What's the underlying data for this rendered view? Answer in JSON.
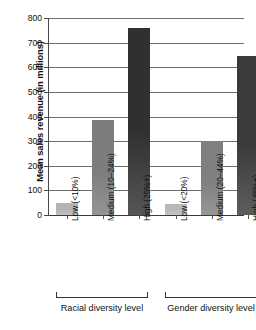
{
  "chart_data": {
    "type": "bar",
    "title": "",
    "xlabel": "",
    "ylabel": "Mean sales revenue (in millions)",
    "ylim": [
      0,
      800
    ],
    "ytick_labels": [
      "0",
      "100",
      "200",
      "300",
      "400",
      "500",
      "600",
      "700",
      "800"
    ],
    "yticks": [
      0,
      100,
      200,
      300,
      400,
      500,
      600,
      700,
      800
    ],
    "grid": true,
    "legend": "none",
    "categories": [
      "Low (<10%)",
      "Medium (10–24%)",
      "High (25%+)",
      "Low (<20%)",
      "Medium (20–44%)",
      "High (45%+)"
    ],
    "values": [
      50,
      385,
      760,
      45,
      300,
      645
    ],
    "bar_colors": [
      "#b4b4b4",
      "#7d7d7d",
      "#303030",
      "#b9b9b9",
      "#808080",
      "#3a3a3a"
    ],
    "groups": [
      {
        "label": "Racial diversity level",
        "categories": [
          "Low (<10%)",
          "Medium (10–24%)",
          "High (25%+)"
        ],
        "values": [
          50,
          385,
          760
        ]
      },
      {
        "label": "Gender diversity level",
        "categories": [
          "Low (<20%)",
          "Medium (20–44%)",
          "High (45%+)"
        ],
        "values": [
          45,
          300,
          645
        ]
      }
    ]
  }
}
